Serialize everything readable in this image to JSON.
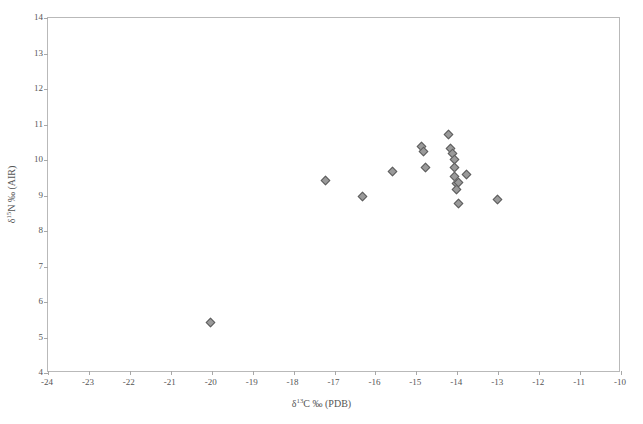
{
  "chart_data": {
    "type": "scatter",
    "title": "",
    "xlabel": "δ¹³C ‰ (PDB)",
    "ylabel": "δ¹⁵N ‰ (AIR)",
    "xlabel_parts": {
      "pre": "δ",
      "sup": "13",
      "post": "C ‰ (PDB)"
    },
    "ylabel_parts": {
      "pre": "δ",
      "sup": "15",
      "post": "N ‰ (AIR)"
    },
    "xlim": [
      -24,
      -10
    ],
    "ylim": [
      4,
      14
    ],
    "xticks": [
      -24,
      -23,
      -22,
      -21,
      -20,
      -19,
      -18,
      -17,
      -16,
      -15,
      -14,
      -13,
      -12,
      -11,
      -10
    ],
    "yticks": [
      4,
      5,
      6,
      7,
      8,
      9,
      10,
      11,
      12,
      13,
      14
    ],
    "xtick_labels": [
      "-24",
      "-23",
      "-22",
      "-21",
      "-20",
      "-19",
      "-18",
      "-17",
      "-16",
      "-15",
      "-14",
      "-13",
      "-12",
      "-11",
      "-10"
    ],
    "ytick_labels": [
      "4",
      "5",
      "6",
      "7",
      "8",
      "9",
      "10",
      "11",
      "12",
      "13",
      "14"
    ],
    "grid": false,
    "legend": null,
    "marker": "diamond",
    "marker_fill": "#9a9a9a",
    "marker_edge": "#5d5d5d",
    "frame_color": "#b9b9b9",
    "series": [
      {
        "name": "samples",
        "points": [
          {
            "x": -20.0,
            "y": 5.4
          },
          {
            "x": -17.2,
            "y": 9.4
          },
          {
            "x": -16.3,
            "y": 8.95
          },
          {
            "x": -15.55,
            "y": 9.65
          },
          {
            "x": -14.85,
            "y": 10.35
          },
          {
            "x": -14.8,
            "y": 10.2
          },
          {
            "x": -14.75,
            "y": 9.75
          },
          {
            "x": -14.2,
            "y": 10.7
          },
          {
            "x": -14.15,
            "y": 10.3
          },
          {
            "x": -14.1,
            "y": 10.15
          },
          {
            "x": -14.05,
            "y": 10.0
          },
          {
            "x": -14.05,
            "y": 9.75
          },
          {
            "x": -14.05,
            "y": 9.5
          },
          {
            "x": -14.0,
            "y": 9.3
          },
          {
            "x": -14.0,
            "y": 9.15
          },
          {
            "x": -13.95,
            "y": 9.35
          },
          {
            "x": -13.75,
            "y": 9.55
          },
          {
            "x": -13.95,
            "y": 8.75
          },
          {
            "x": -13.0,
            "y": 8.85
          }
        ]
      }
    ]
  }
}
